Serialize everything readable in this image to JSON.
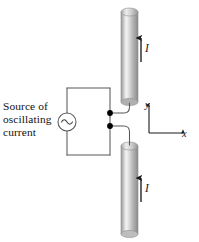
{
  "figure": {
    "background": "#ffffff"
  },
  "source": {
    "label_line1": "Source of",
    "label_line2": "oscillating",
    "label_line3": "current",
    "symbol": "ac-source-sine",
    "symbol_glyph": "~"
  },
  "antennas": [
    {
      "id": "upper-rod",
      "position": "top",
      "current_label": "I",
      "current_direction": "up",
      "x": 121,
      "y": 8,
      "width": 17,
      "height": 97
    },
    {
      "id": "lower-rod",
      "position": "bottom",
      "current_label": "I",
      "current_direction": "up",
      "x": 121,
      "y": 142,
      "width": 17,
      "height": 94
    }
  ],
  "axes": {
    "x_label": "x",
    "y_label": "y",
    "origin_x": 149,
    "origin_y": 133
  },
  "colors": {
    "wire": "#555555",
    "terminal": "#000000",
    "rod_light": "#f2f2f2",
    "rod_mid": "#b9b9b9",
    "rod_dark": "#8e8e8e",
    "text": "#111111",
    "arrow": "#1a1a1a"
  }
}
